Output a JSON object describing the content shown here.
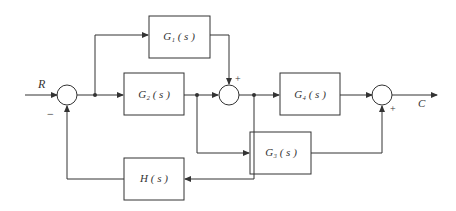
{
  "diagram": {
    "type": "block-diagram",
    "input_label": "R",
    "output_label": "C",
    "blocks": {
      "g1": "G₁ ( s )",
      "g2": "G₂ ( s )",
      "g3": "G₃ ( s )",
      "g4": "G₄ ( s )",
      "h": "H ( s )"
    },
    "signs": {
      "sum1_feedback": "−",
      "sum2_g1": "+",
      "sum3_g3": "+"
    },
    "colors": {
      "line": "#333333",
      "background": "#ffffff"
    }
  }
}
